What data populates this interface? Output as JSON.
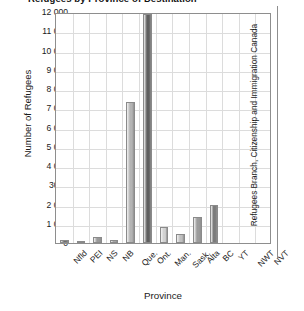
{
  "chart_data": {
    "type": "bar",
    "title": "Refugees by Province of Destination",
    "xlabel": "Province",
    "ylabel": "Number of Refugees",
    "ylim": [
      0,
      12000
    ],
    "ytick_labels": [
      "12 000",
      "11 000",
      "10 000",
      "9 000",
      "8 000",
      "7 000",
      "6 000",
      "5 000",
      "4 000",
      "3000",
      "2 000",
      "1 000",
      "0"
    ],
    "ytick_values": [
      12000,
      11000,
      10000,
      9000,
      8000,
      7000,
      6000,
      5000,
      4000,
      3000,
      2000,
      1000,
      0
    ],
    "grid": true,
    "legend": "none",
    "categories": [
      "Nfld",
      "PEI",
      "NS",
      "NB",
      "Que.",
      "Ont.",
      "Man.",
      "Sask.",
      "Alta",
      "BC",
      "YT",
      "NWT",
      "NVT"
    ],
    "values": [
      170,
      45,
      300,
      180,
      7300,
      11900,
      820,
      460,
      1350,
      1950,
      0,
      0,
      0
    ],
    "bar_colors": [
      "#6e6e6e",
      "#bdbdbd",
      "#9a9a9a",
      "#a8a8a8",
      "#b4b4b4",
      "#5f5f5f",
      "#d2d2d2",
      "#c0c0c0",
      "#9c9c9c",
      "#7b7b7b",
      "#bfbfbf",
      "#bfbfbf",
      "#bfbfbf"
    ],
    "source": "Refugees Branch, Citizenship and Immigration Canada"
  }
}
